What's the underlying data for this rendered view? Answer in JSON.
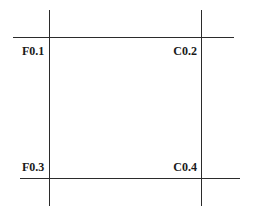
{
  "diagram": {
    "labels": {
      "top_left": "F0.1",
      "top_right": "C0.2",
      "bottom_left": "F0.3",
      "bottom_right": "C0.4"
    },
    "line_color": "#2b2b2b"
  }
}
